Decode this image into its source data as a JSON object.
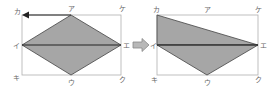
{
  "diagram": {
    "colors": {
      "fill": "#a6a6a6",
      "stroke": "#444444",
      "frame": "#b0b0b0",
      "arrow": "#222222",
      "transform_arrow_fill": "#b8b8b8",
      "transform_arrow_stroke": "#888888"
    },
    "left_figure": {
      "labels": {
        "ka": "カ",
        "a": "ア",
        "ke": "ケ",
        "i": "イ",
        "e": "エ",
        "ki": "キ",
        "u": "ウ",
        "ku": "ク"
      },
      "shape": "rhombus ア-イ-ウ-エ with diagonal イ-エ",
      "motion_arrow": "ア to カ"
    },
    "transform_arrow": "right",
    "right_figure": {
      "labels": {
        "ka": "カ",
        "a": "ア",
        "ke": "ケ",
        "i": "イ",
        "e": "エ",
        "ki": "キ",
        "u": "ウ",
        "ku": "ク"
      },
      "shape": "triangles カ-イ-エ and イ-ウ-エ"
    }
  }
}
